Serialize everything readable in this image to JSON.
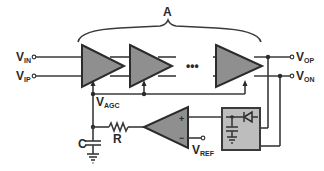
{
  "diagram": {
    "brace_label": "A",
    "inputs": [
      {
        "main": "V",
        "sub": "IN"
      },
      {
        "main": "V",
        "sub": "IP"
      }
    ],
    "outputs": [
      {
        "main": "V",
        "sub": "OP"
      },
      {
        "main": "V",
        "sub": "ON"
      }
    ],
    "control": {
      "main": "V",
      "sub": "AGC"
    },
    "reference": {
      "main": "V",
      "sub": "REF"
    },
    "resistor_label": "R",
    "capacitor_label": "C",
    "ellipsis": "•••",
    "comparator_plus": "+",
    "comparator_minus": "−",
    "colors": {
      "amplifier_fill": "#8f8f8f",
      "detector_fill": "#bdbdbd",
      "wire": "#3a3a3a"
    }
  }
}
